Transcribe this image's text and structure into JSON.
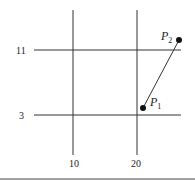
{
  "diagram": {
    "type": "grid-with-points",
    "vertical_lines": [
      {
        "label": "10",
        "x_px": 73
      },
      {
        "label": "20",
        "x_px": 137
      }
    ],
    "horizontal_lines": [
      {
        "label": "11",
        "y_px": 50
      },
      {
        "label": "3",
        "y_px": 115
      }
    ],
    "points": [
      {
        "name": "P",
        "subscript": "1",
        "x_px": 143,
        "y_px": 108
      },
      {
        "name": "P",
        "subscript": "2",
        "x_px": 179,
        "y_px": 40
      }
    ],
    "segment": {
      "from": "P1",
      "to": "P2"
    },
    "colors": {
      "line": "#333333",
      "point": "#111111"
    }
  }
}
